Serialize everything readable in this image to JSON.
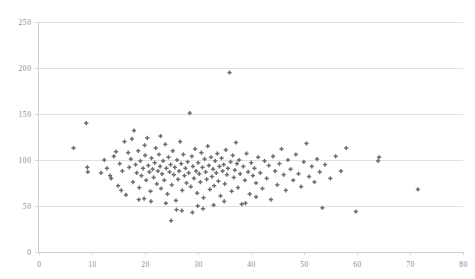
{
  "chart_data": {
    "type": "scatter",
    "title": "",
    "subtitle": "",
    "xlabel": "",
    "ylabel": "",
    "xlim": [
      0,
      80
    ],
    "ylim": [
      0,
      250
    ],
    "xticks": [
      0,
      10,
      20,
      30,
      40,
      50,
      60,
      70,
      80
    ],
    "yticks": [
      0,
      50,
      100,
      150,
      200,
      250
    ],
    "grid": "horizontal",
    "legend": "none",
    "marker": "plus-cross",
    "marker_color": "#6b6b6b",
    "gridline_color": "#d9d9d9",
    "axis_color": "#cfcfcf",
    "background_color": "#ffffff",
    "tick_label_color": "#8a8a8a",
    "point_count": 182,
    "annotations": [],
    "points": [
      [
        6.6,
        113
      ],
      [
        9.0,
        140
      ],
      [
        9.2,
        92
      ],
      [
        9.3,
        87
      ],
      [
        12.4,
        100
      ],
      [
        13.5,
        83
      ],
      [
        13.7,
        80
      ],
      [
        14.2,
        104
      ],
      [
        15.0,
        72
      ],
      [
        15.3,
        96
      ],
      [
        15.8,
        88
      ],
      [
        16.2,
        120
      ],
      [
        16.5,
        62
      ],
      [
        16.9,
        108
      ],
      [
        17.1,
        92
      ],
      [
        17.4,
        101
      ],
      [
        17.8,
        76
      ],
      [
        18.0,
        132
      ],
      [
        18.3,
        95
      ],
      [
        18.5,
        86
      ],
      [
        18.8,
        110
      ],
      [
        19.0,
        70
      ],
      [
        19.2,
        99
      ],
      [
        19.4,
        83
      ],
      [
        19.7,
        91
      ],
      [
        19.9,
        58
      ],
      [
        20.1,
        105
      ],
      [
        20.3,
        78
      ],
      [
        20.5,
        124
      ],
      [
        20.7,
        94
      ],
      [
        20.9,
        87
      ],
      [
        21.1,
        66
      ],
      [
        21.3,
        102
      ],
      [
        21.5,
        90
      ],
      [
        21.7,
        81
      ],
      [
        21.9,
        97
      ],
      [
        22.1,
        113
      ],
      [
        22.3,
        74
      ],
      [
        22.5,
        88
      ],
      [
        22.7,
        106
      ],
      [
        22.9,
        93
      ],
      [
        23.1,
        69
      ],
      [
        23.3,
        85
      ],
      [
        23.5,
        99
      ],
      [
        23.7,
        78
      ],
      [
        23.9,
        117
      ],
      [
        24.1,
        91
      ],
      [
        24.3,
        63
      ],
      [
        24.5,
        103
      ],
      [
        24.7,
        87
      ],
      [
        24.9,
        95
      ],
      [
        25.1,
        73
      ],
      [
        25.3,
        110
      ],
      [
        25.5,
        84
      ],
      [
        25.7,
        92
      ],
      [
        25.9,
        56
      ],
      [
        26.1,
        100
      ],
      [
        26.3,
        79
      ],
      [
        26.5,
        88
      ],
      [
        26.7,
        120
      ],
      [
        26.9,
        96
      ],
      [
        27.1,
        67
      ],
      [
        27.3,
        106
      ],
      [
        27.5,
        83
      ],
      [
        27.7,
        91
      ],
      [
        27.9,
        75
      ],
      [
        28.1,
        98
      ],
      [
        28.3,
        86
      ],
      [
        28.5,
        151
      ],
      [
        28.7,
        71
      ],
      [
        28.9,
        104
      ],
      [
        29.1,
        93
      ],
      [
        29.3,
        80
      ],
      [
        29.5,
        112
      ],
      [
        29.7,
        88
      ],
      [
        29.9,
        64
      ],
      [
        30.1,
        97
      ],
      [
        30.3,
        85
      ],
      [
        30.5,
        76
      ],
      [
        30.7,
        108
      ],
      [
        30.9,
        92
      ],
      [
        31.1,
        59
      ],
      [
        31.3,
        101
      ],
      [
        31.5,
        87
      ],
      [
        31.7,
        79
      ],
      [
        31.9,
        115
      ],
      [
        32.1,
        94
      ],
      [
        32.3,
        68
      ],
      [
        32.5,
        103
      ],
      [
        32.7,
        82
      ],
      [
        32.9,
        90
      ],
      [
        33.1,
        72
      ],
      [
        33.3,
        99
      ],
      [
        33.5,
        86
      ],
      [
        33.7,
        107
      ],
      [
        33.9,
        77
      ],
      [
        34.1,
        93
      ],
      [
        34.3,
        61
      ],
      [
        34.5,
        102
      ],
      [
        34.7,
        88
      ],
      [
        34.9,
        95
      ],
      [
        35.1,
        74
      ],
      [
        35.3,
        111
      ],
      [
        35.5,
        84
      ],
      [
        35.7,
        91
      ],
      [
        36.0,
        195
      ],
      [
        36.2,
        98
      ],
      [
        36.4,
        66
      ],
      [
        36.6,
        105
      ],
      [
        36.8,
        81
      ],
      [
        37.0,
        89
      ],
      [
        37.2,
        119
      ],
      [
        37.4,
        96
      ],
      [
        37.6,
        70
      ],
      [
        37.8,
        100
      ],
      [
        38.0,
        85
      ],
      [
        38.3,
        52
      ],
      [
        38.6,
        93
      ],
      [
        38.9,
        78
      ],
      [
        39.2,
        107
      ],
      [
        39.5,
        87
      ],
      [
        39.8,
        63
      ],
      [
        40.1,
        97
      ],
      [
        40.4,
        83
      ],
      [
        40.7,
        91
      ],
      [
        41.0,
        75
      ],
      [
        41.4,
        103
      ],
      [
        41.8,
        86
      ],
      [
        42.2,
        69
      ],
      [
        42.6,
        99
      ],
      [
        43.0,
        80
      ],
      [
        43.4,
        94
      ],
      [
        43.8,
        57
      ],
      [
        44.2,
        104
      ],
      [
        44.6,
        88
      ],
      [
        45.0,
        73
      ],
      [
        45.4,
        96
      ],
      [
        45.8,
        112
      ],
      [
        46.2,
        84
      ],
      [
        46.6,
        67
      ],
      [
        47.0,
        100
      ],
      [
        47.5,
        90
      ],
      [
        48.0,
        78
      ],
      [
        48.5,
        106
      ],
      [
        49.0,
        85
      ],
      [
        49.5,
        71
      ],
      [
        50.0,
        98
      ],
      [
        50.5,
        118
      ],
      [
        51.0,
        82
      ],
      [
        51.5,
        93
      ],
      [
        52.0,
        76
      ],
      [
        52.5,
        101
      ],
      [
        53.0,
        87
      ],
      [
        53.5,
        48
      ],
      [
        54.0,
        95
      ],
      [
        55.0,
        80
      ],
      [
        56.0,
        104
      ],
      [
        57.0,
        88
      ],
      [
        58.0,
        113
      ],
      [
        59.8,
        44
      ],
      [
        64.0,
        99
      ],
      [
        64.2,
        103
      ],
      [
        71.5,
        68
      ],
      [
        11.8,
        86
      ],
      [
        12.9,
        91
      ],
      [
        14.6,
        109
      ],
      [
        15.6,
        67
      ],
      [
        17.6,
        123
      ],
      [
        18.9,
        57
      ],
      [
        20.0,
        116
      ],
      [
        21.2,
        55
      ],
      [
        23.0,
        126
      ],
      [
        24.0,
        53
      ],
      [
        25.0,
        34
      ],
      [
        26.0,
        46
      ],
      [
        27.0,
        45
      ],
      [
        29.0,
        43
      ],
      [
        30.0,
        50
      ],
      [
        31.0,
        47
      ],
      [
        33.0,
        51
      ],
      [
        35.0,
        55
      ],
      [
        39.0,
        53
      ],
      [
        41.0,
        60
      ]
    ]
  }
}
